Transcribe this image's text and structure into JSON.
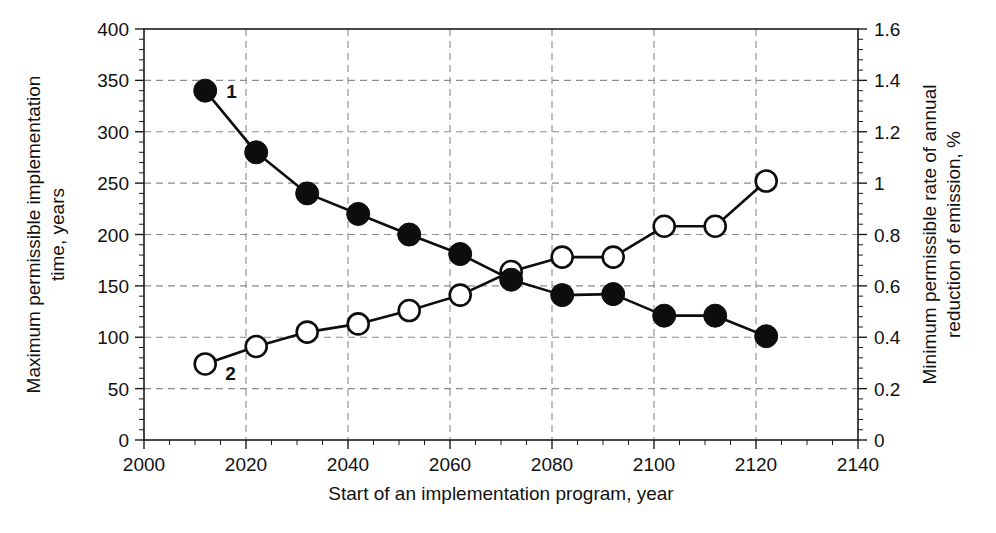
{
  "chart_data": {
    "type": "line",
    "title": "",
    "xlabel": "Start of an implementation program, year",
    "ylabel": "Maximum permissible implementation time, years",
    "y2label": "Minimum permissible rate of annual reduction of emission, %",
    "xlim": [
      2000,
      2140
    ],
    "ylim": [
      0,
      400
    ],
    "y2lim": [
      0,
      1.6
    ],
    "xticks": [
      2000,
      2020,
      2040,
      2060,
      2080,
      2100,
      2120,
      2140
    ],
    "xtick_labels": [
      "2000",
      "2020",
      "2040",
      "2060",
      "2080",
      "2100",
      "2120",
      "2140"
    ],
    "yticks": [
      0,
      50,
      100,
      150,
      200,
      250,
      300,
      350,
      400
    ],
    "ytick_labels": [
      "0",
      "50",
      "100",
      "150",
      "200",
      "250",
      "300",
      "350",
      "400"
    ],
    "y2ticks": [
      0,
      0.2,
      0.4,
      0.6,
      0.8,
      1.0,
      1.2,
      1.4,
      1.6
    ],
    "y2tick_labels": [
      "0",
      "0.2",
      "0.4",
      "0.6",
      "0.8",
      "1",
      "1.2",
      "1.4",
      "1.6"
    ],
    "grid": true,
    "grid_style": "dashed",
    "legend_position": "inline-annotations",
    "x": [
      2012,
      2022,
      2032,
      2042,
      2052,
      2062,
      2072,
      2082,
      2092,
      2102,
      2112,
      2122
    ],
    "series": [
      {
        "name": "1",
        "axis": "left",
        "marker": "filled-circle",
        "annotation": "1",
        "annotation_point_index": 0,
        "values": [
          340,
          280,
          240,
          220,
          200,
          181,
          156,
          141,
          142,
          121,
          121,
          101
        ]
      },
      {
        "name": "2",
        "axis": "right",
        "marker": "open-circle",
        "annotation": "2",
        "annotation_point_index": 0,
        "values_left_scale": [
          74,
          91,
          105,
          113,
          126,
          141,
          164,
          178,
          178,
          208,
          208,
          252
        ],
        "values": [
          0.3,
          0.36,
          0.42,
          0.45,
          0.5,
          0.56,
          0.66,
          0.71,
          0.71,
          0.83,
          0.83,
          1.01
        ]
      }
    ]
  },
  "colors": {
    "series_1": "#0d0d0d",
    "series_2_fill": "#ffffff",
    "series_2_stroke": "#0d0d0d",
    "grid": "#8c8c8c",
    "frame": "#1a1a1a",
    "background": "#ffffff"
  }
}
